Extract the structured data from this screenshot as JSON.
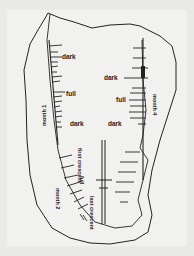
{
  "diagram": {
    "labels": {
      "dark_top_left": "dark",
      "full_left": "full",
      "dark_mid_left": "dark",
      "month1": "month 1",
      "dark_right_top": "dark",
      "full_right": "full",
      "dark_right_bottom": "dark",
      "month4": "month 4",
      "first_crescent": "first crescent",
      "full_lower": "full",
      "month2": "month 2",
      "last_crescent": "last crescent"
    },
    "colors": {
      "background": "#e9e9e7",
      "paper": "#f1f1ef",
      "ink": "#222222"
    }
  }
}
